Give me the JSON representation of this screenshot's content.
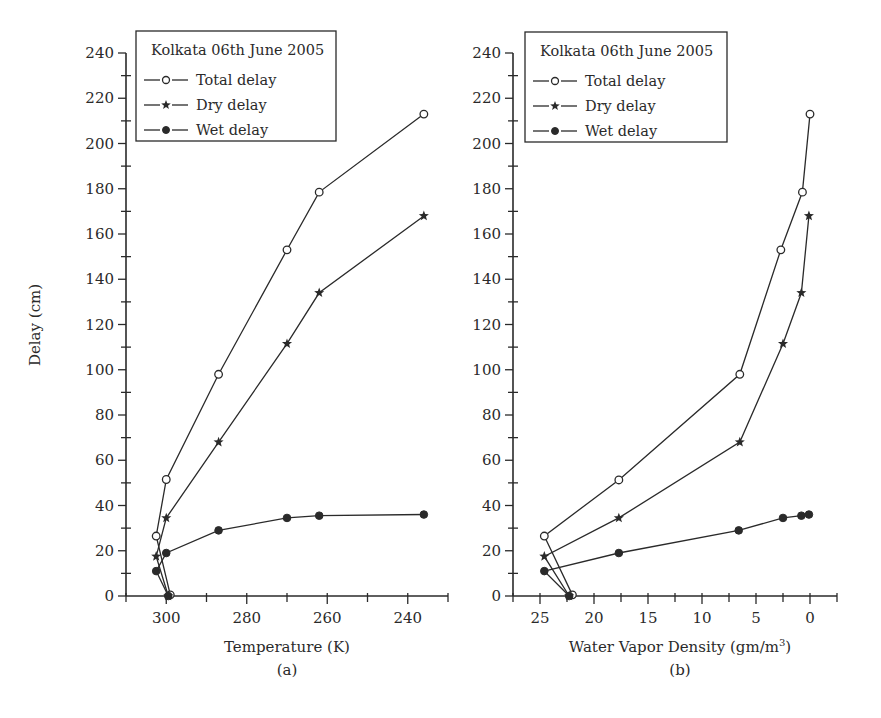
{
  "figure": {
    "colors": {
      "ink": "#2a2a2a",
      "background": "#ffffff"
    }
  },
  "chart_data": [
    {
      "id": "a",
      "type": "line",
      "title": "",
      "caption": "(a)",
      "legend_title": "Kolkata 06th June 2005",
      "legend_position": "upper-left",
      "xlabel": "Temperature (K)",
      "ylabel": "Delay (cm)",
      "xlim": [
        310,
        230
      ],
      "ylim": [
        0,
        240
      ],
      "x_reversed": true,
      "xticks": [
        300,
        280,
        260,
        240
      ],
      "xminor_step": 10,
      "yticks": [
        0,
        20,
        40,
        60,
        80,
        100,
        120,
        140,
        160,
        180,
        200,
        220,
        240
      ],
      "yminor_step": 10,
      "grid": false,
      "series": [
        {
          "name": "Total delay",
          "marker": "open-circle",
          "points": [
            [
              299,
              0.5
            ],
            [
              302.5,
              26.5
            ],
            [
              300,
              51.5
            ],
            [
              287,
              98
            ],
            [
              270,
              153
            ],
            [
              262,
              178.5
            ],
            [
              236,
              213
            ]
          ]
        },
        {
          "name": "Dry delay",
          "marker": "star",
          "points": [
            [
              299.5,
              0
            ],
            [
              302.5,
              17.5
            ],
            [
              300,
              34.5
            ],
            [
              287,
              68
            ],
            [
              270,
              111.5
            ],
            [
              262,
              134
            ],
            [
              236,
              168
            ]
          ]
        },
        {
          "name": "Wet delay",
          "marker": "filled-circle",
          "points": [
            [
              299.5,
              0
            ],
            [
              302.5,
              11
            ],
            [
              300,
              19
            ],
            [
              287,
              29
            ],
            [
              270,
              34.5
            ],
            [
              262,
              35.5
            ],
            [
              236,
              36
            ]
          ]
        }
      ]
    },
    {
      "id": "b",
      "type": "line",
      "title": "",
      "caption": "(b)",
      "legend_title": "Kolkata 06th June 2005",
      "legend_position": "upper-left",
      "xlabel": "Water Vapor Density (gm/m",
      "xlabel_sup": "3",
      "xlabel_end": ")",
      "ylabel": "",
      "xlim": [
        27.5,
        -2.5
      ],
      "ylim": [
        0,
        240
      ],
      "x_reversed": true,
      "xticks": [
        25,
        20,
        15,
        10,
        5,
        0
      ],
      "xminor_step": 2.5,
      "yticks": [
        0,
        20,
        40,
        60,
        80,
        100,
        120,
        140,
        160,
        180,
        200,
        220,
        240
      ],
      "yminor_step": 10,
      "grid": false,
      "series": [
        {
          "name": "Total delay",
          "marker": "open-circle",
          "points": [
            [
              22,
              0.5
            ],
            [
              24.6,
              26.5
            ],
            [
              17.7,
              51.3
            ],
            [
              6.5,
              98
            ],
            [
              2.7,
              153
            ],
            [
              0.7,
              178.5
            ],
            [
              0,
              213
            ]
          ]
        },
        {
          "name": "Dry delay",
          "marker": "star",
          "points": [
            [
              22.3,
              0
            ],
            [
              24.6,
              17.5
            ],
            [
              17.7,
              34.5
            ],
            [
              6.5,
              68
            ],
            [
              2.5,
              111.5
            ],
            [
              0.8,
              134
            ],
            [
              0.1,
              168
            ]
          ]
        },
        {
          "name": "Wet delay",
          "marker": "filled-circle",
          "points": [
            [
              22.3,
              0
            ],
            [
              24.6,
              11
            ],
            [
              17.7,
              19
            ],
            [
              6.6,
              29
            ],
            [
              2.5,
              34.5
            ],
            [
              0.8,
              35.5
            ],
            [
              0.1,
              36
            ]
          ]
        }
      ]
    }
  ]
}
